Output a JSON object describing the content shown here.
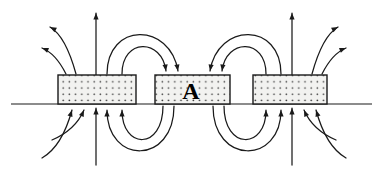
{
  "figure": {
    "domain": "diagram",
    "canvas": {
      "width": 380,
      "height": 178,
      "background": "#ffffff"
    },
    "colors": {
      "stroke": "#1a1a1a",
      "block_fill": "#f2f2f0",
      "block_border": "#1a1a1a",
      "dot": "#3a3a3a",
      "label": "#000000"
    },
    "baseline": {
      "name": "horizontal-reference-line",
      "x1": 11,
      "x2": 372,
      "y": 104,
      "stroke_width": 1.2
    },
    "blocks": [
      {
        "id": "left",
        "name": "left-block",
        "x": 58,
        "y": 75,
        "width": 78,
        "height": 29,
        "label": ""
      },
      {
        "id": "middle",
        "name": "middle-block",
        "x": 155,
        "y": 75,
        "width": 75,
        "height": 29,
        "label": "A"
      },
      {
        "id": "right",
        "name": "right-block",
        "x": 253,
        "y": 75,
        "width": 74,
        "height": 29,
        "label": ""
      }
    ],
    "block_label": {
      "text": "A",
      "x": 191,
      "y": 99,
      "font_size": 24
    },
    "hatch": {
      "pattern": "dot-grid",
      "spacing": 6.2,
      "dot_radius": 0.85
    },
    "arrow_head": {
      "length": 6.5,
      "half_width": 2.6
    },
    "field_lines": {
      "description": "Closed magnetic field loops: flux exits block tops upward and re-enters neighbouring block tops; below the reference line flux loops back upward into the block bottoms.",
      "top_vertical": [
        {
          "name": "top-vertical-arrow-left",
          "x": 96,
          "y_start": 75,
          "y_end": 13,
          "direction": "up"
        },
        {
          "name": "top-vertical-arrow-right",
          "x": 292,
          "y_start": 75,
          "y_end": 13,
          "direction": "up"
        }
      ],
      "bottom_vertical": [
        {
          "name": "bottom-vertical-arrow-left",
          "x": 96,
          "y_start": 165,
          "y_end": 108,
          "direction": "up"
        },
        {
          "name": "bottom-vertical-arrow-right",
          "x": 292,
          "y_start": 165,
          "y_end": 108,
          "direction": "up"
        }
      ],
      "top_outward_left": [
        {
          "name": "top-outward-arc-left-outer",
          "path": "M 76,74 C 70,52 62,34 50,27",
          "arrow_at": "end",
          "angle_deg": 208
        },
        {
          "name": "top-outward-arc-left-inner",
          "path": "M 66,74 C 60,62 52,52 42,48",
          "arrow_at": "end",
          "angle_deg": 201
        }
      ],
      "top_outward_right": [
        {
          "name": "top-outward-arc-right-outer",
          "path": "M 312,74 C 318,52 326,34 338,27",
          "arrow_at": "end",
          "angle_deg": -28
        },
        {
          "name": "top-outward-arc-right-inner",
          "path": "M 322,74 C 328,62 336,52 346,48",
          "arrow_at": "end",
          "angle_deg": -21
        }
      ],
      "top_loops_left_to_middle": [
        {
          "name": "top-loop-outer-left-middle",
          "path": "M 107,74 C 107,22 170,22 178,71",
          "arrow_at": "end",
          "angle_deg": 80
        },
        {
          "name": "top-loop-inner-left-middle",
          "path": "M 122,74 C 122,38 162,38 166,71",
          "arrow_at": "end",
          "angle_deg": 82
        }
      ],
      "top_loops_right_to_middle": [
        {
          "name": "top-loop-outer-right-middle",
          "path": "M 281,74 C 281,22 218,22 210,71",
          "arrow_at": "end",
          "angle_deg": 100
        },
        {
          "name": "top-loop-inner-right-middle",
          "path": "M 266,74 C 266,38 226,38 222,71",
          "arrow_at": "end",
          "angle_deg": 98
        }
      ],
      "bottom_loops_left": [
        {
          "name": "bottom-loop-outer-left",
          "path": "M 174,106 C 174,165 107,165 107,110",
          "arrow_at": "end",
          "angle_deg": -90
        },
        {
          "name": "bottom-loop-inner-left",
          "path": "M 163,106 C 163,150 122,150 122,110",
          "arrow_at": "end",
          "angle_deg": -90
        }
      ],
      "bottom_loops_right": [
        {
          "name": "bottom-loop-outer-right",
          "path": "M 213,106 C 213,165 281,165 281,110",
          "arrow_at": "end",
          "angle_deg": -90
        },
        {
          "name": "bottom-loop-inner-right",
          "path": "M 224,106 C 224,150 266,150 266,110",
          "arrow_at": "end",
          "angle_deg": -90
        }
      ],
      "bottom_inward_left": [
        {
          "name": "bottom-inward-arc-left-outer",
          "path": "M 42,158 C 56,150 66,132 72,110",
          "arrow_at": "end",
          "angle_deg": -72
        },
        {
          "name": "bottom-inward-arc-left-inner",
          "path": "M 52,140 C 66,134 78,124 84,110",
          "arrow_at": "end",
          "angle_deg": -66
        }
      ],
      "bottom_inward_right": [
        {
          "name": "bottom-inward-arc-right-outer",
          "path": "M 346,158 C 332,150 322,132 316,110",
          "arrow_at": "end",
          "angle_deg": -108
        },
        {
          "name": "bottom-inward-arc-right-inner",
          "path": "M 336,140 C 322,134 310,124 304,110",
          "arrow_at": "end",
          "angle_deg": -114
        }
      ]
    }
  }
}
